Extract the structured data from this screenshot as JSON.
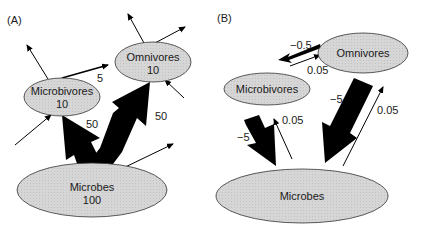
{
  "panels": [
    {
      "label": "(A)",
      "nodes": {
        "microbivores": {
          "name": "Microbivores",
          "value": "10"
        },
        "omnivores": {
          "name": "Omnivores",
          "value": "10"
        },
        "microbes": {
          "name": "Microbes",
          "value": "100"
        }
      },
      "flows": {
        "microbivores_to_omnivores": "5",
        "microbes_to_microbivores": "50",
        "microbes_to_omnivores": "50"
      }
    },
    {
      "label": "(B)",
      "nodes": {
        "microbivores": {
          "name": "Microbivores"
        },
        "omnivores": {
          "name": "Omnivores"
        },
        "microbes": {
          "name": "Microbes"
        }
      },
      "effects": {
        "omnivores_on_microbivores": "−0.5",
        "microbivores_on_omnivores": "0.05",
        "microbivores_on_microbes": "−5",
        "microbes_on_microbivores": "0.05",
        "omnivores_on_microbes": "−5",
        "microbes_on_omnivores": "0.05"
      }
    }
  ],
  "colors": {
    "node_fill": "#d3d3d3",
    "node_stroke": "#333333",
    "arrow": "#000000"
  }
}
